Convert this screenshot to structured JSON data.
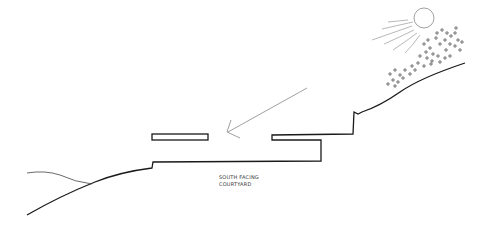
{
  "diagram": {
    "type": "hand-drawn section sketch",
    "labels": {
      "courtyard_line1": "SOUTH FACING",
      "courtyard_line2": "COURTYARD"
    },
    "elements": [
      "sun",
      "sun-rays",
      "vegetation-dots",
      "hillside",
      "upper-slab",
      "lower-slab",
      "sunlight-arrow",
      "ground-left"
    ],
    "colors": {
      "stroke": "#1a1a1a",
      "light_stroke": "#777777",
      "background": "#ffffff"
    }
  }
}
